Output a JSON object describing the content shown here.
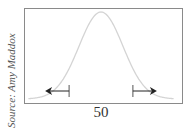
{
  "source_credit": "Source: Amy Maddox",
  "colors": {
    "curve": "#d4d4d4",
    "frame": "#8a8a8a",
    "arrow": "#222222",
    "text": "#333333"
  },
  "chart_data": {
    "type": "line",
    "title": "",
    "mean_label": "50",
    "x_tick_labels": [
      "50"
    ],
    "curve": {
      "distribution": "normal",
      "mean": 0,
      "sd": 1,
      "x_range_sd": [
        -3.3,
        3.3
      ]
    },
    "tail_markers": [
      {
        "side": "left",
        "at_sd": -1.45,
        "direction": "left"
      },
      {
        "side": "right",
        "at_sd": 1.45,
        "direction": "right"
      }
    ],
    "xlabel": "",
    "ylabel": "",
    "grid": false
  }
}
